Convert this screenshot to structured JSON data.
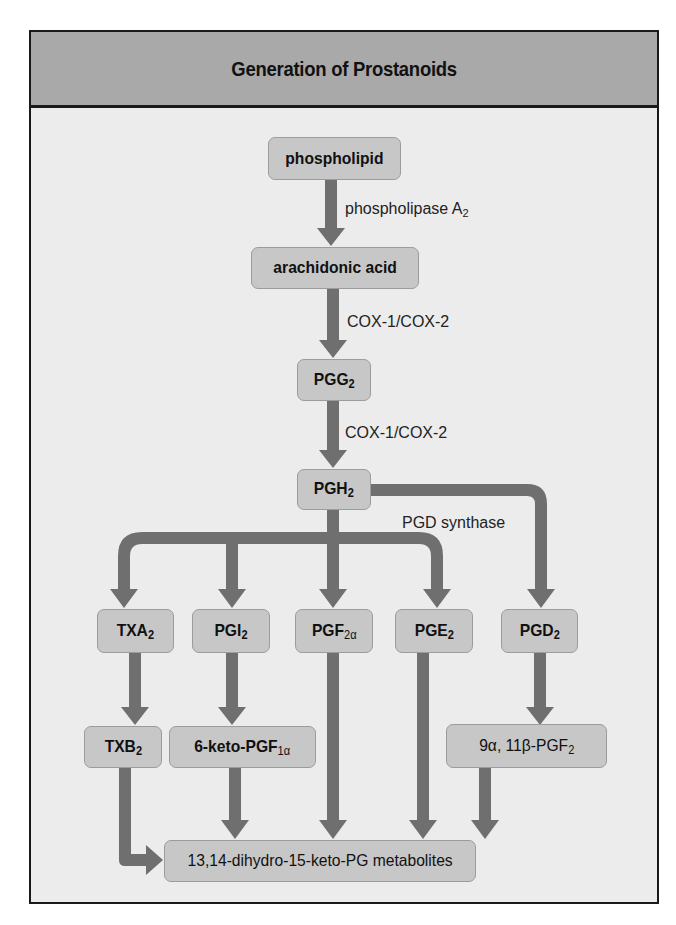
{
  "title": "Generation of Prostanoids",
  "nodes": {
    "phospholipid": {
      "text": "phospholipid",
      "sub": ""
    },
    "arachidonic_acid": {
      "text": "arachidonic acid",
      "sub": ""
    },
    "pgg2": {
      "text": "PGG",
      "sub": "2"
    },
    "pgh2": {
      "text": "PGH",
      "sub": "2"
    },
    "txa2": {
      "text": "TXA",
      "sub": "2"
    },
    "pgi2": {
      "text": "PGI",
      "sub": "2"
    },
    "pgf2a": {
      "text": "PGF",
      "sub": "2α"
    },
    "pge2": {
      "text": "PGE",
      "sub": "2"
    },
    "pgd2": {
      "text": "PGD",
      "sub": "2"
    },
    "txb2": {
      "text": "TXB",
      "sub": "2"
    },
    "keto_pgf1a": {
      "text": "6-keto-PGF",
      "sub": "1α"
    },
    "pgf2_9a11b": {
      "text": "9α, 11β-PGF",
      "sub": "2"
    },
    "metabolites": {
      "text": "13,14-dihydro-15-keto-PG metabolites",
      "sub": ""
    }
  },
  "enzymes": {
    "pla2": {
      "text": "phospholipase A",
      "sub": "2"
    },
    "cox_1": {
      "text": "COX-1/COX-2"
    },
    "cox_2": {
      "text": "COX-1/COX-2"
    },
    "pgd_synthase": {
      "text": "PGD synthase"
    }
  },
  "edges": [
    {
      "from": "phospholipid",
      "to": "arachidonic_acid",
      "label": "phospholipase A2"
    },
    {
      "from": "arachidonic_acid",
      "to": "pgg2",
      "label": "COX-1/COX-2"
    },
    {
      "from": "pgg2",
      "to": "pgh2",
      "label": "COX-1/COX-2"
    },
    {
      "from": "pgh2",
      "to": "txa2"
    },
    {
      "from": "pgh2",
      "to": "pgi2"
    },
    {
      "from": "pgh2",
      "to": "pgf2a"
    },
    {
      "from": "pgh2",
      "to": "pge2"
    },
    {
      "from": "pgh2",
      "to": "pgd2",
      "label": "PGD synthase"
    },
    {
      "from": "txa2",
      "to": "txb2"
    },
    {
      "from": "pgi2",
      "to": "keto_pgf1a"
    },
    {
      "from": "pgd2",
      "to": "pgf2_9a11b"
    },
    {
      "from": "txb2",
      "to": "metabolites"
    },
    {
      "from": "keto_pgf1a",
      "to": "metabolites"
    },
    {
      "from": "pgf2a",
      "to": "metabolites"
    },
    {
      "from": "pge2",
      "to": "metabolites"
    },
    {
      "from": "pgf2_9a11b",
      "to": "metabolites"
    }
  ],
  "colors": {
    "header_bg": "#a9a9a9",
    "panel_bg": "#ececec",
    "node_bg": "#c7c7c7",
    "arrow": "#6f6f6f",
    "border": "#1a1a1a"
  }
}
